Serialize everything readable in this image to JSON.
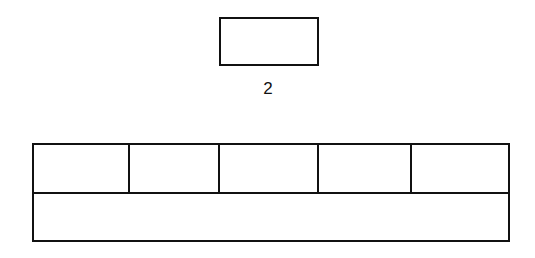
{
  "diagram": {
    "small_box": {
      "label": "2",
      "x": 220,
      "y": 18,
      "w": 98,
      "h": 47
    },
    "large_box": {
      "x": 33,
      "y": 144,
      "w": 476,
      "h": 97,
      "row_split_y": 193,
      "top_row_cells": 5,
      "dividers_x": [
        129,
        219,
        318,
        411
      ],
      "bottom_row_cells": 1
    },
    "stroke_color": "#111111",
    "background_color": "#ffffff"
  }
}
